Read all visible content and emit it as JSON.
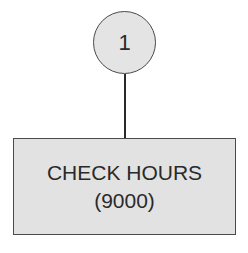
{
  "diagram": {
    "step_node": {
      "label": "1"
    },
    "action_node": {
      "line1": "CHECK HOURS",
      "line2": "(9000)"
    },
    "colors": {
      "fill": "#e3e3e3",
      "stroke": "#4a4a4a",
      "text": "#2a2a2a"
    }
  }
}
